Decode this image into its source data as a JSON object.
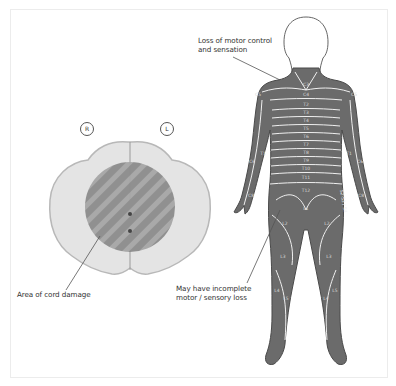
{
  "figure": {
    "cross_section": {
      "side_right": "R",
      "side_left": "L",
      "callout": "Area of cord damage"
    },
    "body": {
      "callout_top_line1": "Loss of motor control",
      "callout_top_line2": "and sensation",
      "callout_bottom_line1": "May have incomplete",
      "callout_bottom_line2": "motor / sensory loss",
      "dermatomes": {
        "neck": "C3",
        "shoulder": "C4",
        "trunk": [
          "T2",
          "T3",
          "T4",
          "T5",
          "T6",
          "T7",
          "T8",
          "T9",
          "T10",
          "T11",
          "T12"
        ],
        "arm_r": [
          "C5",
          "T1",
          "C6",
          "C8"
        ],
        "arm_l": [
          "C5",
          "T1",
          "C6",
          "C8"
        ],
        "groin": "L1",
        "thigh": [
          "L2",
          "L2"
        ],
        "knee": [
          "L3",
          "L3"
        ],
        "shin": [
          "L4",
          "L4",
          "L5",
          "L5"
        ],
        "side_text": "S2-S3 / S4"
      }
    },
    "colors": {
      "damaged_fill": "#6b6b6b",
      "cord_grey": "#9a9a9a",
      "cord_white_matter": "#e6e6e6",
      "outline": "#ffffff",
      "border": "#ececec"
    }
  }
}
